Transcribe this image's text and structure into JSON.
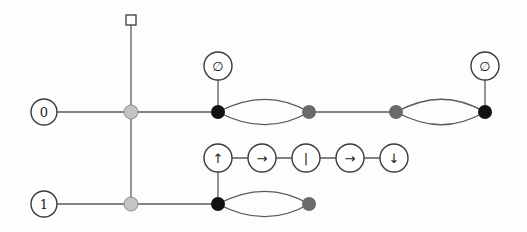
{
  "diagram": {
    "type": "zx-calculus-style graph",
    "colors": {
      "background": "#fdfdfc",
      "wire": "#5a5a5a",
      "light_spider": "#c4c4c4",
      "dark_spider": "#6a6a6a",
      "black_spider": "#111111",
      "node_outline": "#3a3a3a"
    },
    "inputs": [
      {
        "label": "0",
        "x": 44,
        "y": 112
      },
      {
        "label": "1",
        "x": 44,
        "y": 204
      }
    ],
    "square_node": {
      "x": 131,
      "y": 20
    },
    "empty_labels": [
      {
        "label": "∅",
        "x": 218,
        "y": 66
      },
      {
        "label": "∅",
        "x": 485,
        "y": 66
      }
    ],
    "chain": [
      {
        "label": "↑",
        "x": 218,
        "y": 158
      },
      {
        "label": "→",
        "x": 262,
        "y": 158
      },
      {
        "label": "|",
        "x": 306,
        "y": 158
      },
      {
        "label": "→",
        "x": 350,
        "y": 158
      },
      {
        "label": "↓",
        "x": 394,
        "y": 158
      }
    ],
    "spiders": [
      {
        "kind": "light",
        "x": 131,
        "y": 112
      },
      {
        "kind": "light",
        "x": 131,
        "y": 204
      },
      {
        "kind": "black",
        "x": 218,
        "y": 112
      },
      {
        "kind": "dark",
        "x": 309,
        "y": 112
      },
      {
        "kind": "dark",
        "x": 396,
        "y": 112
      },
      {
        "kind": "black",
        "x": 485,
        "y": 112
      },
      {
        "kind": "black",
        "x": 218,
        "y": 204
      },
      {
        "kind": "dark",
        "x": 309,
        "y": 204
      }
    ]
  }
}
